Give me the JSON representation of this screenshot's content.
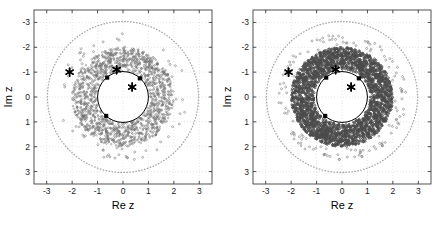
{
  "figure": {
    "title": "",
    "panel_count": 2,
    "background_color": "#ffffff"
  },
  "colors": {
    "scatter_gray": "#6e6e6e",
    "scatter_dense_gray": "#4a4a4a",
    "dotted_circle_gray": "#a8a8a8",
    "unit_circle_black": "#000000",
    "marker_black": "#000000",
    "axis_black": "#262626",
    "grid_gray": "#cccccc"
  },
  "panels": [
    {
      "name": "left-panel",
      "xlabel": "Re z",
      "ylabel": "Im z",
      "xticks": [
        "-3",
        "-2",
        "-1",
        "0",
        "1",
        "2",
        "3"
      ],
      "yticks": [
        "3",
        "2",
        "1",
        "0",
        "-1",
        "-2",
        "-3"
      ]
    },
    {
      "name": "right-panel",
      "xlabel": "Re z",
      "ylabel": "Im z",
      "xticks": [
        "-3",
        "-2",
        "-1",
        "0",
        "1",
        "2",
        "3"
      ],
      "yticks": [
        "3",
        "2",
        "1",
        "0",
        "-1",
        "-2",
        "-3"
      ]
    }
  ],
  "chart_data": [
    {
      "type": "scatter",
      "panel": "left",
      "title": "",
      "xlabel": "Re z",
      "ylabel": "Im z",
      "xlim": [
        -3.5,
        3.5
      ],
      "ylim": [
        -3.5,
        3.5
      ],
      "xticks": [
        -3,
        -2,
        -1,
        0,
        1,
        2,
        3
      ],
      "yticks": [
        -3,
        -2,
        -1,
        0,
        1,
        2,
        3
      ],
      "grid": true,
      "legend": "none",
      "series": [
        {
          "name": "scatter-cloud",
          "marker": "circle",
          "color": "#6e6e6e",
          "description": "diffuse annulus of points, inner radius about 1.05, outer radius about 2.0, with sparse outliers out to radius 2.5",
          "annulus_inner_radius": 1.05,
          "annulus_outer_radius": 2.0,
          "outlier_radius": 2.55,
          "point_count": 1600,
          "density": "diffuse"
        },
        {
          "name": "unit-circle",
          "type": "curve",
          "color": "#000000",
          "radius": 1.0,
          "style": "solid"
        },
        {
          "name": "outer-dotted-circle",
          "type": "curve",
          "color": "#a8a8a8",
          "radius": 2.97,
          "style": "dotted"
        },
        {
          "name": "star-markers",
          "marker": "star",
          "color": "#000000",
          "points": [
            {
              "re": -2.1,
              "im": 1.0
            },
            {
              "re": -0.25,
              "im": 1.1
            },
            {
              "re": 0.36,
              "im": 0.4
            }
          ]
        },
        {
          "name": "square-markers",
          "marker": "square",
          "color": "#000000",
          "points": [
            {
              "re": -0.62,
              "im": 0.78
            },
            {
              "re": 0.66,
              "im": 0.75
            },
            {
              "re": -0.66,
              "im": -0.76
            }
          ]
        }
      ]
    },
    {
      "type": "scatter",
      "panel": "right",
      "title": "",
      "xlabel": "Re z",
      "ylabel": "Im z",
      "xlim": [
        -3.5,
        3.5
      ],
      "ylim": [
        -3.5,
        3.5
      ],
      "xticks": [
        -3,
        -2,
        -1,
        0,
        1,
        2,
        3
      ],
      "yticks": [
        -3,
        -2,
        -1,
        0,
        1,
        2,
        3
      ],
      "grid": true,
      "legend": "none",
      "series": [
        {
          "name": "scatter-cloud",
          "marker": "circle",
          "color": "#4a4a4a",
          "description": "dense saturated annulus of points, inner radius about 1.1, outer radius about 2.0, with sparse outliers out to radius 2.5",
          "annulus_inner_radius": 1.1,
          "annulus_outer_radius": 2.0,
          "outlier_radius": 2.55,
          "point_count": 3200,
          "density": "dense"
        },
        {
          "name": "unit-circle",
          "type": "curve",
          "color": "#000000",
          "radius": 1.0,
          "style": "solid"
        },
        {
          "name": "outer-dotted-circle",
          "type": "curve",
          "color": "#a8a8a8",
          "radius": 2.97,
          "style": "dotted"
        },
        {
          "name": "star-markers",
          "marker": "star",
          "color": "#000000",
          "points": [
            {
              "re": -2.1,
              "im": 1.0
            },
            {
              "re": -0.25,
              "im": 1.1
            },
            {
              "re": 0.36,
              "im": 0.4
            }
          ]
        },
        {
          "name": "square-markers",
          "marker": "square",
          "color": "#000000",
          "points": [
            {
              "re": -0.62,
              "im": 0.78
            },
            {
              "re": 0.66,
              "im": 0.75
            },
            {
              "re": -0.66,
              "im": -0.76
            }
          ]
        }
      ]
    }
  ]
}
